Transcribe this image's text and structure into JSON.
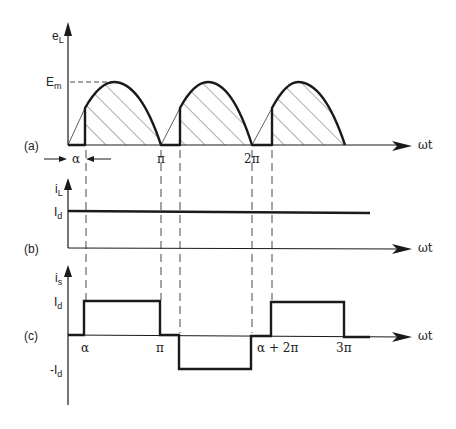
{
  "panels": {
    "a": {
      "tag": "(a)",
      "y_label": "e",
      "y_sub": "L",
      "level_label": "E",
      "level_sub": "m",
      "x_label": "ωt",
      "alpha_label": "α",
      "pi_label": "π",
      "two_pi_label": "2π"
    },
    "b": {
      "tag": "(b)",
      "y_label": "i",
      "y_sub": "L",
      "level_label": "I",
      "level_sub": "d",
      "x_label": "ωt"
    },
    "c": {
      "tag": "(c)",
      "y_label": "i",
      "y_sub": "s",
      "pos_label": "I",
      "pos_sub": "d",
      "neg_label": "-I",
      "neg_sub": "d",
      "x_label": "ωt",
      "ticks": [
        "α",
        "π",
        "α + 2π",
        "3π"
      ]
    }
  },
  "colors": {
    "line": "#1a1a1a",
    "hatch": "#333333",
    "background": "#ffffff"
  }
}
